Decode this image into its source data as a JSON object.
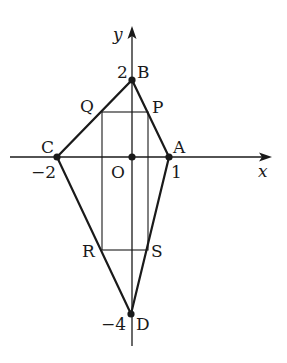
{
  "figure": {
    "type": "coordinate-geometry",
    "axes": {
      "x_label": "x",
      "y_label": "y",
      "origin_label": "O"
    },
    "points": [
      {
        "name": "A",
        "coord": [
          1,
          0
        ],
        "tick": "1"
      },
      {
        "name": "B",
        "coord": [
          0,
          2
        ],
        "tick": "2"
      },
      {
        "name": "C",
        "coord": [
          -2,
          0
        ],
        "tick": "−2"
      },
      {
        "name": "D",
        "coord": [
          0,
          -4
        ],
        "tick": "−4"
      },
      {
        "name": "P",
        "on": "AB"
      },
      {
        "name": "Q",
        "on": "BC"
      },
      {
        "name": "R",
        "on": "CD"
      },
      {
        "name": "S",
        "on": "DA"
      }
    ],
    "shapes": [
      "quadrilateral ABCD",
      "rectangle PQRS"
    ],
    "labels": {
      "x": "x",
      "y": "y",
      "O": "O",
      "A": "A",
      "B": "B",
      "C": "C",
      "D": "D",
      "P": "P",
      "Q": "Q",
      "R": "R",
      "S": "S",
      "tick_A": "1",
      "tick_B": "2",
      "tick_C": "−2",
      "tick_D": "−4"
    },
    "colors": {
      "stroke": "#1a1a1a",
      "background": "#ffffff"
    }
  }
}
